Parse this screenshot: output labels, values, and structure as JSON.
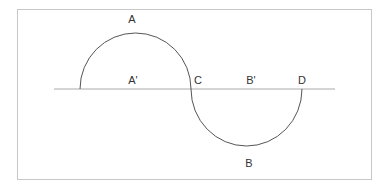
{
  "diagram": {
    "type": "s-curve-semicircles",
    "labels": {
      "A": "A",
      "A_prime": "A'",
      "B": "B",
      "B_prime": "B'",
      "C": "C",
      "D": "D"
    },
    "colors": {
      "curve": "#555555",
      "baseline": "#aaaaaa",
      "frame": "#c8c8c8",
      "text": "#333333"
    }
  }
}
